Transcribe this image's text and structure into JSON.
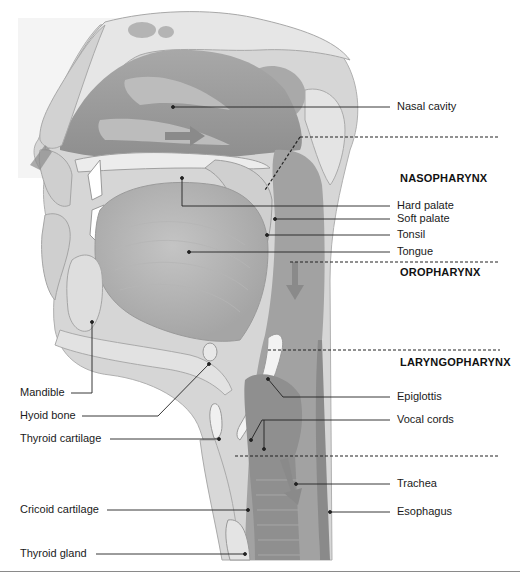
{
  "diagram": {
    "regions": [
      {
        "label": "NASOPHARYNX",
        "x": 400,
        "y": 178
      },
      {
        "label": "OROPHARYNX",
        "x": 400,
        "y": 270
      },
      {
        "label": "LARYNGOPHARYNX",
        "x": 400,
        "y": 360
      }
    ],
    "right_labels": [
      {
        "label": "Nasal cavity",
        "x": 397,
        "y": 102
      },
      {
        "label": "Hard palate",
        "x": 397,
        "y": 203
      },
      {
        "label": "Soft palate",
        "x": 397,
        "y": 216
      },
      {
        "label": "Tonsil",
        "x": 397,
        "y": 232
      },
      {
        "label": "Tongue",
        "x": 397,
        "y": 248
      },
      {
        "label": "Epiglottis",
        "x": 397,
        "y": 394
      },
      {
        "label": "Vocal cords",
        "x": 397,
        "y": 417
      },
      {
        "label": "Trachea",
        "x": 397,
        "y": 482
      },
      {
        "label": "Esophagus",
        "x": 397,
        "y": 510
      }
    ],
    "left_labels": [
      {
        "label": "Mandible",
        "x": 20,
        "y": 388
      },
      {
        "label": "Hyoid bone",
        "x": 20,
        "y": 411
      },
      {
        "label": "Thyroid cartilage",
        "x": 20,
        "y": 434
      },
      {
        "label": "Cricoid cartilage",
        "x": 20,
        "y": 504
      },
      {
        "label": "Thyroid gland",
        "x": 20,
        "y": 548
      }
    ],
    "colors": {
      "tissue_light": "#d9d9d9",
      "tissue_mid": "#bdbdbd",
      "tissue_dark": "#8f8f8f",
      "bone": "#e8e8e8",
      "airway": "#9e9e9e",
      "arrow": "#7a7a7a",
      "leader_line": "#222222",
      "text": "#1a1a1a"
    },
    "airflow_arrows": [
      "nostril-inflow",
      "nasal-cavity",
      "oropharynx-down",
      "trachea-down"
    ]
  }
}
